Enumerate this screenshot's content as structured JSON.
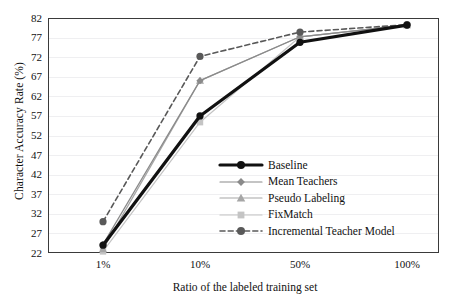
{
  "chart_data": {
    "type": "line",
    "title": "",
    "xlabel": "Ratio of the labeled training set",
    "ylabel": "Character Accuracy Rate (%)",
    "categories": [
      "1%",
      "10%",
      "50%",
      "100%"
    ],
    "xticklabels": [
      "1%",
      "10%",
      "50%",
      "100%"
    ],
    "yticklabels": [
      "22",
      "27",
      "32",
      "37",
      "42",
      "47",
      "52",
      "57",
      "62",
      "67",
      "72",
      "77",
      "82"
    ],
    "ytickvalues": [
      22,
      27,
      32,
      37,
      42,
      47,
      52,
      57,
      62,
      67,
      72,
      77,
      82
    ],
    "ylim": [
      22,
      82
    ],
    "grid": true,
    "legend_position": "center-right",
    "series": [
      {
        "name": "Baseline",
        "values": [
          24.0,
          57.0,
          75.8,
          80.2
        ],
        "color": "#111111",
        "marker": "circle",
        "linestyle": "solid",
        "linewidth": 3.2
      },
      {
        "name": "Mean Teachers",
        "values": [
          24.2,
          66.0,
          77.2,
          80.2
        ],
        "color": "#8a8a8a",
        "marker": "diamond",
        "linestyle": "solid",
        "linewidth": 1.2
      },
      {
        "name": "Pseudo Labeling",
        "values": [
          23.0,
          66.0,
          77.2,
          80.2
        ],
        "color": "#a6a6a6",
        "marker": "triangle",
        "linestyle": "solid",
        "linewidth": 1.2
      },
      {
        "name": "FixMatch",
        "values": [
          22.4,
          55.4,
          77.2,
          80.2
        ],
        "color": "#c4c4c4",
        "marker": "square",
        "linestyle": "solid",
        "linewidth": 1.2
      },
      {
        "name": "Incremental Teacher Model",
        "values": [
          30.0,
          72.2,
          78.4,
          80.3
        ],
        "color": "#595959",
        "marker": "circle",
        "linestyle": "dashed",
        "linewidth": 1.6
      }
    ]
  }
}
